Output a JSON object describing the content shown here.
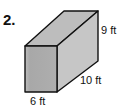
{
  "problem": {
    "number": "2.",
    "shape": "rectangular-prism",
    "labels": {
      "height": "9 ft",
      "length": "10 ft",
      "width": "6 ft"
    }
  },
  "colors": {
    "front_face": "#a9a9a9",
    "side_face": "#c6c6c6",
    "top_face": "#bdbdbd",
    "edge": "#111111"
  }
}
